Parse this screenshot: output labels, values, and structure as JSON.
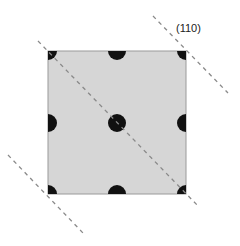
{
  "diagram": {
    "type": "crystal-plane-2d-unit-cell",
    "plane_label": "(110)",
    "cell": {
      "x": 48,
      "y": 51,
      "width": 138,
      "height": 143,
      "fill": "#d6d6d6",
      "stroke": "#9a9a9a"
    },
    "atom_color": "#111111",
    "line_color": "#8a8a8a",
    "atoms": [
      {
        "pos": "corner-top-left"
      },
      {
        "pos": "edge-top-mid"
      },
      {
        "pos": "corner-top-right"
      },
      {
        "pos": "edge-left-mid"
      },
      {
        "pos": "center"
      },
      {
        "pos": "edge-right-mid"
      },
      {
        "pos": "corner-bottom-left"
      },
      {
        "pos": "edge-bottom-mid"
      },
      {
        "pos": "corner-bottom-right"
      }
    ],
    "plane_lines": 3
  }
}
